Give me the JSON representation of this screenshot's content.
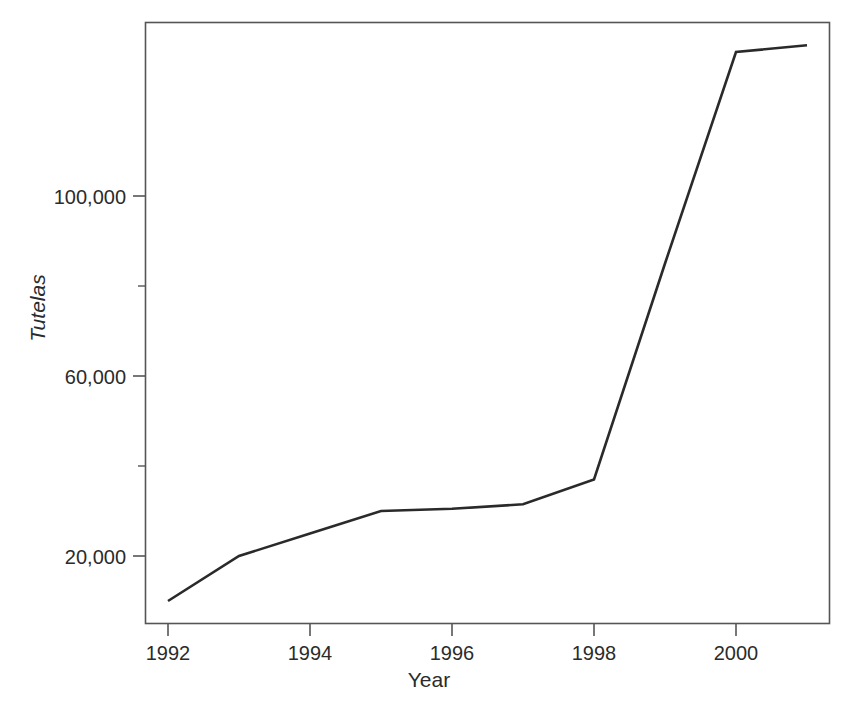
{
  "chart_data": {
    "type": "line",
    "title": "",
    "xlabel": "Year",
    "ylabel": "Tutelas",
    "x": [
      1992,
      1993,
      1994,
      1995,
      1996,
      1997,
      1998,
      1999,
      2000,
      2001
    ],
    "values": [
      10000,
      20000,
      25000,
      30000,
      30500,
      31500,
      37000,
      85000,
      132000,
      133500
    ],
    "series": [
      {
        "name": "Tutelas",
        "values": [
          10000,
          20000,
          25000,
          30000,
          30500,
          31500,
          37000,
          85000,
          132000,
          133500
        ]
      }
    ],
    "xlim": [
      1991.65,
      1992.0
    ],
    "ylim": [
      0,
      145000
    ],
    "x_ticks": [
      1992,
      1994,
      1996,
      1998,
      2000
    ],
    "x_tick_labels": [
      "1992",
      "1994",
      "1996",
      "1998",
      "2000"
    ],
    "y_ticks": [
      20000,
      40000,
      60000,
      80000,
      100000
    ],
    "y_tick_labels": [
      "20,000",
      "",
      "60,000",
      "",
      "100,000"
    ],
    "y_major_labels": [
      "20,000",
      "60,000",
      "100,000"
    ],
    "grid": false,
    "legend": false,
    "legend_position": "none",
    "line_color": "#2a2a2a",
    "axis_color": "#555555",
    "background_color": "#ffffff"
  },
  "axes": {
    "x_title": "Year",
    "y_title": "Tutelas"
  },
  "y_axis_labels": [
    {
      "text": "100,000",
      "top": 186
    },
    {
      "text": "60,000",
      "top": 366
    },
    {
      "text": "20,000",
      "top": 546
    }
  ],
  "x_axis_labels": [
    {
      "text": "1992",
      "left": 168
    },
    {
      "text": "1994",
      "left": 310
    },
    {
      "text": "1996",
      "left": 452
    },
    {
      "text": "1998",
      "left": 594
    },
    {
      "text": "2000",
      "left": 736
    }
  ]
}
